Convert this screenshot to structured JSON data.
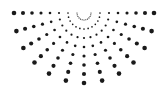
{
  "graphic": {
    "name": "radial-dot-burst",
    "canvas": {
      "width": 168,
      "height": 93,
      "background": "#ffffff"
    },
    "center": {
      "x": 84,
      "y": 13
    },
    "dot_color": "#1a1a1a",
    "rays": 13,
    "start_angle_deg": 0,
    "end_angle_deg": 180,
    "dots_per_ray": 8,
    "inner_radius": 7,
    "outer_radius": 70,
    "min_dot_radius": 0.6,
    "max_dot_radius": 2.3
  }
}
